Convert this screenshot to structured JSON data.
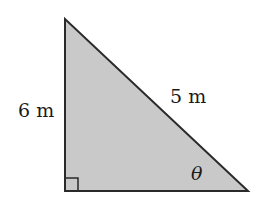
{
  "diagram": {
    "type": "right-triangle",
    "vertices": {
      "top": [
        65,
        19
      ],
      "right_angle": [
        65,
        191
      ],
      "acute_bottom": [
        248,
        191
      ]
    },
    "fill_color": "#c9c9c9",
    "stroke_color": "#2a2a2a",
    "right_angle_marker_size": 13,
    "labels": {
      "vertical_side": "6 m",
      "hypotenuse": "5 m",
      "angle": "θ"
    }
  }
}
